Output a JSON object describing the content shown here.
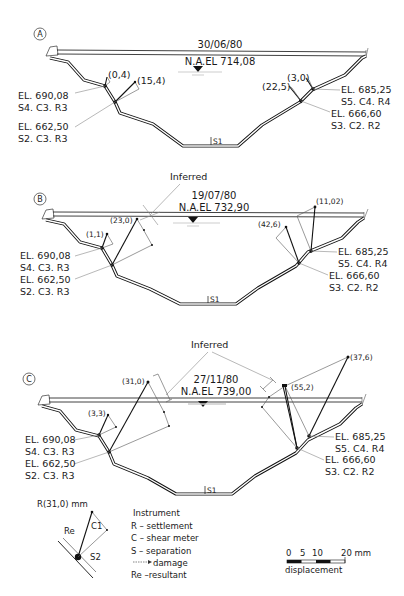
{
  "figure": {
    "sections": [
      {
        "id": "A",
        "date": "30/06/80",
        "water_level": "N.A.EL 714,08",
        "left_upper": {
          "elevation": "EL. 690,08",
          "instruments": "S4. C3. R3",
          "reading": "(0,4)"
        },
        "left_lower": {
          "elevation": "EL. 662,50",
          "instruments": "S2. C3. R3",
          "reading": "(15,4)"
        },
        "right_upper": {
          "elevation": "EL. 685,25",
          "instruments": "S5. C4. R4",
          "reading": "(3,0)"
        },
        "right_lower": {
          "elevation": "EL. 666,60",
          "instruments": "S3. C2. R2",
          "reading": "(22,5)"
        },
        "bottom_marker": "S1",
        "inferred_label": ""
      },
      {
        "id": "B",
        "date": "19/07/80",
        "water_level": "N.A.EL 732,90",
        "left_upper": {
          "elevation": "EL. 690,08",
          "instruments": "S4. C3. R3",
          "reading": "(1,1)"
        },
        "left_lower": {
          "elevation": "EL. 662,50",
          "instruments": "S2. C3. R3",
          "reading": "(23,0)"
        },
        "right_upper": {
          "elevation": "EL. 685,25",
          "instruments": "S5. C4. R4",
          "reading": "(11,02)"
        },
        "right_lower": {
          "elevation": "EL. 666,60",
          "instruments": "S3. C2. R2",
          "reading": "(42,6)"
        },
        "bottom_marker": "S1",
        "inferred_label": "Inferred"
      },
      {
        "id": "C",
        "date": "27/11/80",
        "water_level": "N.A.EL 739,00",
        "left_upper": {
          "elevation": "EL. 690,08",
          "instruments": "S4. C3. R3",
          "reading": "(3,3)"
        },
        "left_lower": {
          "elevation": "EL. 662,50",
          "instruments": "S2. C3. R3",
          "reading": "(31,0)"
        },
        "right_upper": {
          "elevation": "EL. 685,25",
          "instruments": "S5. C4. R4",
          "reading": "(37,6)"
        },
        "right_lower": {
          "elevation": "EL. 666,60",
          "instruments": "S3. C2. R2",
          "reading": "(55,2)"
        },
        "bottom_marker": "S1",
        "inferred_label": "Inferred"
      }
    ]
  },
  "key_diagram": {
    "title": "R(31,0) mm",
    "re_label": "Re",
    "c_label": "C1",
    "s_label": "S2"
  },
  "legend": {
    "title": "Instrument",
    "items": [
      "R – settlement",
      "C – shear meter",
      "S –  separation",
      "damage",
      "Re –resultant"
    ]
  },
  "scale_bar": {
    "ticks": [
      "0",
      "5",
      "10",
      "20 mm"
    ],
    "label": "displacement"
  }
}
